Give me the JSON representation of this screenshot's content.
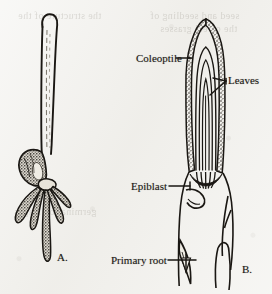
{
  "figure": {
    "background_color": "#f1f0ec",
    "ink_color": "#1a1713",
    "panels": [
      {
        "letter": "A.",
        "name": "whole-seedling",
        "description": "Whole grass seedling with elongated coleoptile shoot, seed, and fibrous seminal roots"
      },
      {
        "letter": "B.",
        "name": "longitudinal-section",
        "description": "Longitudinal section through the seedling showing coleoptile, enclosed leaves, epiblast and primary root"
      }
    ],
    "labels": [
      {
        "id": "coleoptile",
        "text": "Coleoptile"
      },
      {
        "id": "leaves",
        "text": "Leaves"
      },
      {
        "id": "epiblast",
        "text": "Epiblast"
      },
      {
        "id": "primary_root",
        "text": "Primary root"
      }
    ],
    "ghost_text": {
      "line_1": "the structure of the",
      "line_2": "seed and seedling of",
      "line_3": "the cereal grasses",
      "line_4": "germination stages"
    }
  }
}
